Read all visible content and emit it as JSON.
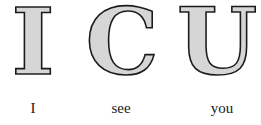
{
  "letters": [
    {
      "glyph": "I",
      "caption": "I"
    },
    {
      "glyph": "C",
      "caption": "see"
    },
    {
      "glyph": "U",
      "caption": "you"
    }
  ],
  "colors": {
    "letter_fill": "#d6d6d6",
    "letter_outline": "#1a1a1a",
    "caption_text": "#1a1a1a",
    "background": "#ffffff"
  }
}
